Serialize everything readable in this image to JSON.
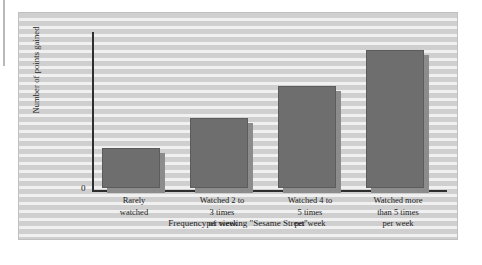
{
  "figure": {
    "frame_color": "#c0c0c0",
    "background_color": "#d2d2d2"
  },
  "chart_data": {
    "type": "bar",
    "title": "",
    "xlabel": "Frequency of viewing \"Sesame Street\"",
    "ylabel": "Number of points gained",
    "categories": [
      "Rarely\nwatched",
      "Watched 2 to\n3 times\nper week",
      "Watched 4 to\n5 times\nper week",
      "Watched more\nthan 5 times\nper week"
    ],
    "category_lines": [
      [
        "Rarely",
        "watched"
      ],
      [
        "Watched 2 to",
        "3 times",
        "per week"
      ],
      [
        "Watched 4 to",
        "5 times",
        "per week"
      ],
      [
        "Watched more",
        "than 5 times",
        "per week"
      ]
    ],
    "values": [
      29,
      51,
      74,
      100
    ],
    "ylim": [
      0,
      110
    ],
    "ytick_labels": [
      "0"
    ],
    "grid": false,
    "legend": null,
    "bar_color": "#6e6e6e",
    "bar_shadow_color": "#8c8c8c"
  },
  "axes": {
    "y_zero_label": "0",
    "y_title": "Number of points gained",
    "x_title": "Frequency of viewing \"Sesame Street\""
  }
}
